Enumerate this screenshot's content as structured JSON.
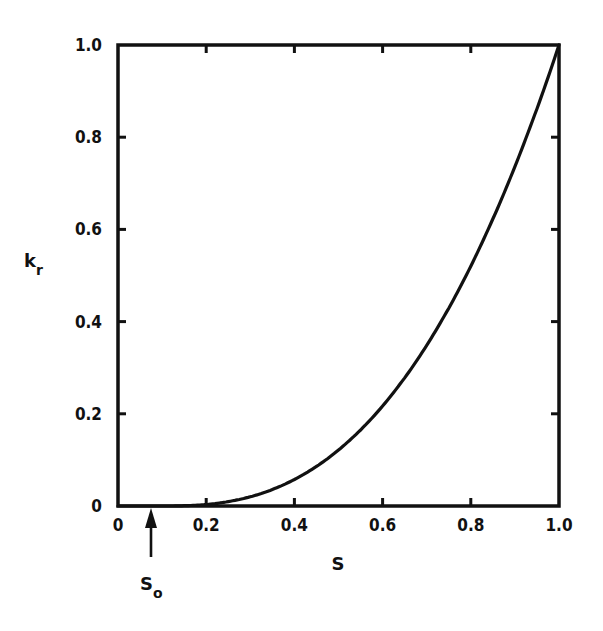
{
  "chart_data": {
    "type": "line",
    "title": "",
    "xlabel": "S",
    "ylabel": "k_r",
    "ylabel_main": "k",
    "ylabel_sub": "r",
    "xlim": [
      0,
      1.0
    ],
    "ylim": [
      0,
      1.0
    ],
    "grid": false,
    "legend": null,
    "x_ticks": [
      "0",
      "0.2",
      "0.4",
      "0.6",
      "0.8",
      "1.0"
    ],
    "y_ticks": [
      "0",
      "0.2",
      "0.4",
      "0.6",
      "0.8",
      "1.0"
    ],
    "annotation": {
      "label_main": "S",
      "label_sub": "o",
      "x": 0.1,
      "type": "arrow-up-to-axis"
    },
    "series": [
      {
        "name": "k_r(S)",
        "x": [
          0,
          0.1,
          0.15,
          0.2,
          0.3,
          0.4,
          0.5,
          0.6,
          0.7,
          0.8,
          0.9,
          1.0
        ],
        "values": [
          0,
          0,
          0.001,
          0.004,
          0.02,
          0.05,
          0.1,
          0.17,
          0.28,
          0.44,
          0.67,
          1.0
        ]
      }
    ]
  }
}
